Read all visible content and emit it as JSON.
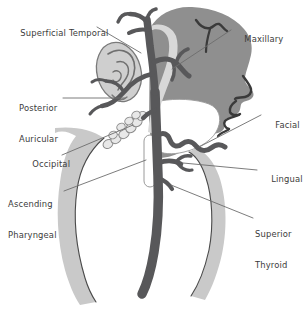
{
  "figure": {
    "type": "anatomical-diagram",
    "background_color": "#ffffff"
  },
  "colors": {
    "head_silhouette": "#8f8f8f",
    "artery_dark": "#58585a",
    "neck_band_light": "#c9c9c9",
    "ear_fill": "#cfcfcf",
    "node_fill": "#e8e8e8",
    "node_stroke": "#8a8a8a",
    "leader_line": "#6d6d6d",
    "outline": "#4a4a4a",
    "label_text": "#3b3b3b",
    "white": "#ffffff"
  },
  "labels": {
    "superficial_temporal": "Superficial Temporal",
    "posterior_auricular_line1": "Posterior",
    "posterior_auricular_line2": "Auricular",
    "occipital": "Occipital",
    "ascending_pharyngeal_line1": "Ascending",
    "ascending_pharyngeal_line2": "Pharyngeal",
    "maxillary": "Maxillary",
    "facial": "Facial",
    "lingual": "Lingual",
    "superior_thyroid_line1": "Superior",
    "superior_thyroid_line2": "Thyroid"
  },
  "callouts": [
    {
      "id": "superficial-temporal",
      "side": "left",
      "text": "Superficial Temporal",
      "x": 9,
      "y": 18
    },
    {
      "id": "posterior-auricular",
      "side": "left",
      "text": "Posterior Auricular",
      "x": 19,
      "y": 83
    },
    {
      "id": "occipital",
      "side": "left",
      "text": "Occipital",
      "x": 21,
      "y": 148
    },
    {
      "id": "ascending-pharyngeal",
      "side": "left",
      "text": "Ascending Pharyngeal",
      "x": 8,
      "y": 179
    },
    {
      "id": "maxillary",
      "side": "right",
      "text": "Maxillary",
      "x": 232,
      "y": 24
    },
    {
      "id": "facial",
      "side": "right",
      "text": "Facial",
      "x": 263,
      "y": 110
    },
    {
      "id": "lingual",
      "side": "right",
      "text": "Lingual",
      "x": 259,
      "y": 163
    },
    {
      "id": "superior-thyroid",
      "side": "right",
      "text": "Superior Thyroid",
      "x": 254,
      "y": 208
    }
  ]
}
